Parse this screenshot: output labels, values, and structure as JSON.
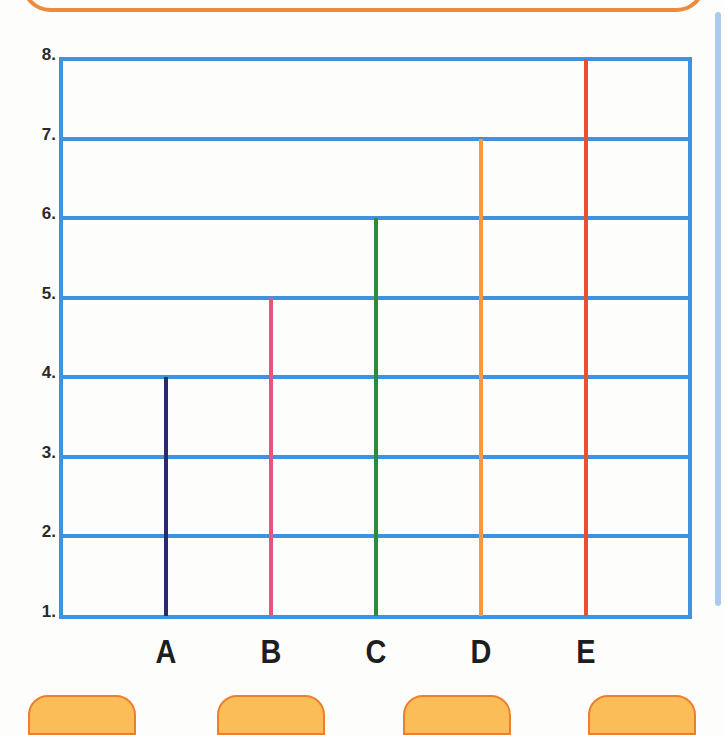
{
  "chart_data": {
    "type": "bar",
    "title": "",
    "xlabel": "",
    "ylabel": "",
    "categories": [
      "A",
      "B",
      "C",
      "D",
      "E"
    ],
    "values": [
      4,
      5,
      6,
      7,
      8
    ],
    "bar_colors": [
      "#2c2a6e",
      "#e4567e",
      "#2f8b3c",
      "#f59a42",
      "#e8502f"
    ],
    "ylim": [
      1,
      8
    ],
    "yticks": [
      "1.",
      "2.",
      "3.",
      "4.",
      "5.",
      "6.",
      "7.",
      "8."
    ],
    "grid": true,
    "grid_color": "#3d93e0",
    "legend": null,
    "bar_style": "thin vertical lines"
  },
  "decor": {
    "frame_color": "#3d93e0",
    "top_box_border": "#ee8a3a",
    "tab_fill": "#fbbd57",
    "tab_border": "#ec8030",
    "side_bar_color": "#a9cbee"
  }
}
